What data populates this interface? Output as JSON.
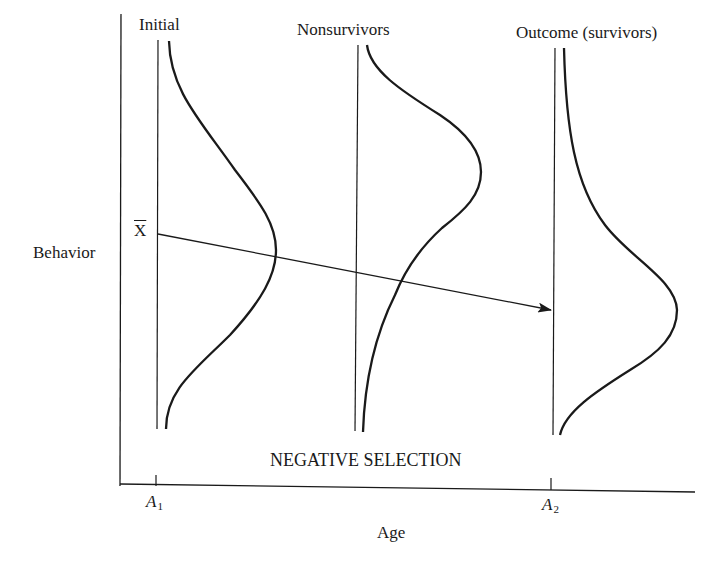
{
  "diagram": {
    "title": "NEGATIVE SELECTION",
    "y_axis_label": "Behavior",
    "x_axis_label": "Age",
    "mean_label": "X",
    "x_ticks": [
      {
        "label": "A",
        "subscript": "1"
      },
      {
        "label": "A",
        "subscript": "2"
      }
    ],
    "distributions": [
      {
        "label": "Initial",
        "shape": "symmetric bell, mean at X-bar"
      },
      {
        "label": "Nonsurvivors",
        "shape": "bell shifted upward (higher behavior)"
      },
      {
        "label": "Outcome (survivors)",
        "shape": "bell shifted downward (lower behavior)"
      }
    ],
    "arrow": {
      "from": "X-bar at A1",
      "to": "survivor mean at A2"
    },
    "stroke_color": "#1a1a1a",
    "background_color": "#ffffff"
  }
}
